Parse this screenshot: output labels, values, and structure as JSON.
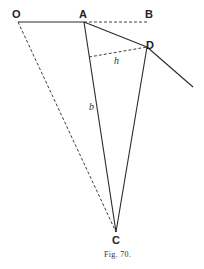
{
  "figure": {
    "caption": "Fig. 70.",
    "points": {
      "O": {
        "label": "O",
        "x": 18,
        "y": 22
      },
      "A": {
        "label": "A",
        "x": 84,
        "y": 22
      },
      "B": {
        "label": "B",
        "x": 148,
        "y": 22
      },
      "D": {
        "label": "D",
        "x": 147,
        "y": 47
      },
      "C": {
        "label": "C",
        "x": 116,
        "y": 232
      }
    },
    "variables": {
      "h": "h",
      "b": "b"
    },
    "segments": [
      {
        "from": "O",
        "to": "A",
        "style": "solid"
      },
      {
        "from": "A",
        "to": "B",
        "style": "dashed"
      },
      {
        "from": "A",
        "to": "D",
        "style": "solid"
      },
      {
        "from": "D",
        "to": "extension",
        "style": "solid"
      },
      {
        "from": "A",
        "to": "C",
        "style": "solid",
        "label": "b"
      },
      {
        "from": "D",
        "to": "C",
        "style": "solid"
      },
      {
        "from": "O",
        "to": "C",
        "style": "dashed"
      },
      {
        "from": "AC-foot",
        "to": "D",
        "style": "dashed",
        "label": "h"
      }
    ]
  }
}
